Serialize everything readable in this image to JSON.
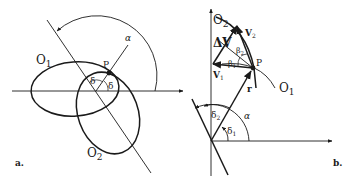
{
  "panel_a": {
    "caption": "a.",
    "labels": {
      "ellipse1": "O",
      "ellipse1_sub": "1",
      "ellipse2": "O",
      "ellipse2_sub": "2",
      "point": "P",
      "angle_alpha": "α",
      "angle_delta_left": "δ",
      "angle_delta_right": "δ"
    }
  },
  "panel_b": {
    "caption": "b.",
    "labels": {
      "curve1": "O",
      "curve1_sub": "1",
      "curve2": "O",
      "curve2_sub": "2",
      "point": "P",
      "delta_v": "ΔV",
      "v1": "V",
      "v1_sub": "1",
      "v2": "V",
      "v2_sub": "2",
      "beta1": "β",
      "beta1_sub": "1",
      "beta2": "β",
      "beta2_sub": "2",
      "radius": "r",
      "angle_alpha": "α",
      "delta1": "δ",
      "delta1_sub": "1",
      "delta2": "δ",
      "delta2_sub": "2"
    }
  },
  "colors": {
    "ink": "#1a1a1a",
    "background": "#ffffff"
  }
}
